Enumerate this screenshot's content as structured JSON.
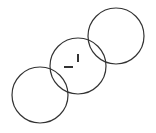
{
  "diagram": {
    "background": "#ffffff",
    "stroke_color": "#333333",
    "circles": [
      {
        "name": "circle-top-right",
        "cx": 116,
        "cy": 36,
        "r": 28
      },
      {
        "name": "circle-middle",
        "cx": 78,
        "cy": 66,
        "r": 28
      },
      {
        "name": "circle-bottom-left",
        "cx": 40,
        "cy": 95,
        "r": 28
      }
    ],
    "marks": [
      {
        "name": "horizontal-dash",
        "x1": 64,
        "y1": 67,
        "x2": 73,
        "y2": 67
      },
      {
        "name": "vertical-tick",
        "x1": 78,
        "y1": 54,
        "x2": 78,
        "y2": 62
      }
    ]
  }
}
